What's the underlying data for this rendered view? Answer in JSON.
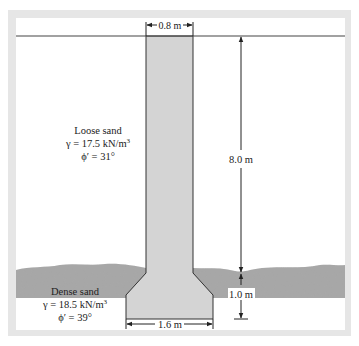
{
  "diagram": {
    "pile_top_width": "0.8 m",
    "pile_length": "8.0 m",
    "bell_height": "1.0 m",
    "base_width": "1.6 m",
    "upper_layer": {
      "name": "Loose sand",
      "gamma": "γ = 17.5 kN/m",
      "gamma_exp": "3",
      "phi": "ϕ′ = 31°"
    },
    "lower_layer": {
      "name": "Dense sand",
      "gamma": "γ = 18.5 kN/m",
      "gamma_exp": "3",
      "phi": "ϕ′ = 39°"
    },
    "colors": {
      "frame": "#e6e6e6",
      "concrete": "#d4d4d4",
      "dense_sand": "#a9a9a9",
      "line": "#222222"
    }
  }
}
